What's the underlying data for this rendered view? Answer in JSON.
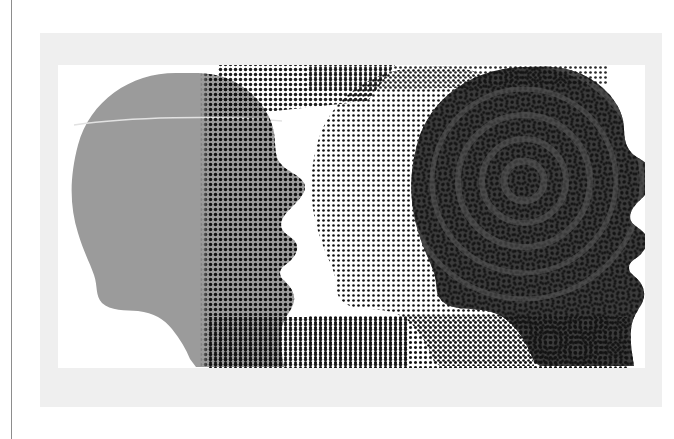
{
  "artwork": {
    "title": "Two Heads In Profile",
    "description": "Graphic illustration: two facing-right human head silhouettes, one flat mid-gray, one dark gray, overlaid with halftone dot screens that produce moire interference patterns.",
    "medium": "halftone screen print",
    "orientation": "landscape"
  },
  "page": {
    "background_color": "#ffffff",
    "rule_color": "#8d8d8d",
    "rule_x": 11,
    "rule_label": "page-margin-rule"
  },
  "frame": {
    "mat_color": "#efefef",
    "mat_label": "outer-mat",
    "artboard_color": "#ffffff",
    "artboard_label": "inner-artboard",
    "mat_x": 40,
    "mat_y": 33,
    "mat_w": 622,
    "mat_h": 374,
    "artboard_x": 58,
    "artboard_y": 65,
    "artboard_w": 587,
    "artboard_h": 303
  },
  "colors": {
    "head_light": "#9b9b9b",
    "head_dark": "#3b3b3b",
    "dot_black": "#111111",
    "hairline": "#e2e2e2",
    "white": "#ffffff"
  },
  "figures": [
    {
      "id": "head-left",
      "label": "left-head-silhouette",
      "fill": "#9b9b9b",
      "facing": "right",
      "screen": "vertical-gradient-dot-screen",
      "screen_note": "halftone dots increase in density from left to right across the face"
    },
    {
      "id": "head-ghost",
      "label": "ghost-head-dot-outline",
      "fill": "none",
      "facing": "right",
      "screen": "offset-dot-field",
      "screen_note": "dot field forming an offset duplicate head silhouette behind the dark head"
    },
    {
      "id": "head-right",
      "label": "right-head-silhouette",
      "fill": "#3b3b3b",
      "facing": "right",
      "screen": "concentric-moire-dot-screen",
      "screen_note": "overlapping dot grids produce hexagonal concentric moire rings over the cranium"
    }
  ],
  "screens": {
    "dot_pitch_px": 5,
    "dot_radius_px": 1.5,
    "moire_rings_label": "moire-interference-rings",
    "dot_field_label": "halftone-dot-field"
  }
}
